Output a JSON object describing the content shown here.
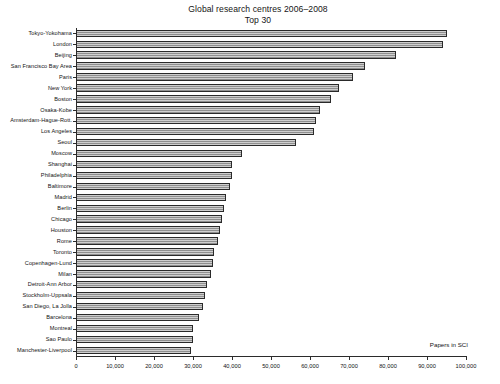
{
  "chart_data": {
    "type": "bar",
    "orientation": "horizontal",
    "title": "Global research centres 2006–2008",
    "subtitle": "Top 30",
    "xlabel": "Papers in SCI",
    "ylabel": "",
    "xlim": [
      0,
      100000
    ],
    "ylim": null,
    "grid": false,
    "legend": null,
    "xticks": [
      0,
      10000,
      20000,
      30000,
      40000,
      50000,
      60000,
      70000,
      80000,
      90000,
      100000
    ],
    "xticklabels": [
      "0",
      "10,000",
      "20,000",
      "30,000",
      "40,000",
      "50,000",
      "60,000",
      "70,000",
      "80,000",
      "90,000",
      "100,000"
    ],
    "categories": [
      "Tokyo-Yokohama",
      "London",
      "Beijing",
      "San Francisco Bay Area",
      "Paris",
      "New York",
      "Boston",
      "Osaka-Kobe",
      "Amsterdam-Hague-Rott.",
      "Los Angeles",
      "Seoul",
      "Moscow",
      "Shanghai",
      "Philadelphia",
      "Baltimore",
      "Madrid",
      "Berlin",
      "Chicago",
      "Houston",
      "Rome",
      "Toronto",
      "Copenhagen-Lund",
      "Milan",
      "Detroit-Ann Arbor",
      "Stockholm-Uppsala",
      "San Diego, La Jolla",
      "Barcelona",
      "Montreal",
      "Sao Paulo",
      "Manchester-Liverpool"
    ],
    "values": [
      95000,
      94000,
      82000,
      74000,
      71000,
      67500,
      65500,
      62500,
      61500,
      61000,
      56500,
      42500,
      40000,
      40000,
      39500,
      38500,
      38000,
      37500,
      37000,
      36500,
      35500,
      35000,
      34500,
      33500,
      33000,
      32500,
      31500,
      30000,
      30000,
      29500
    ],
    "bar_style": {
      "fill": "#a8a8a8",
      "pattern": "horizontal-stripes",
      "edge": "#2a2a2a"
    }
  }
}
